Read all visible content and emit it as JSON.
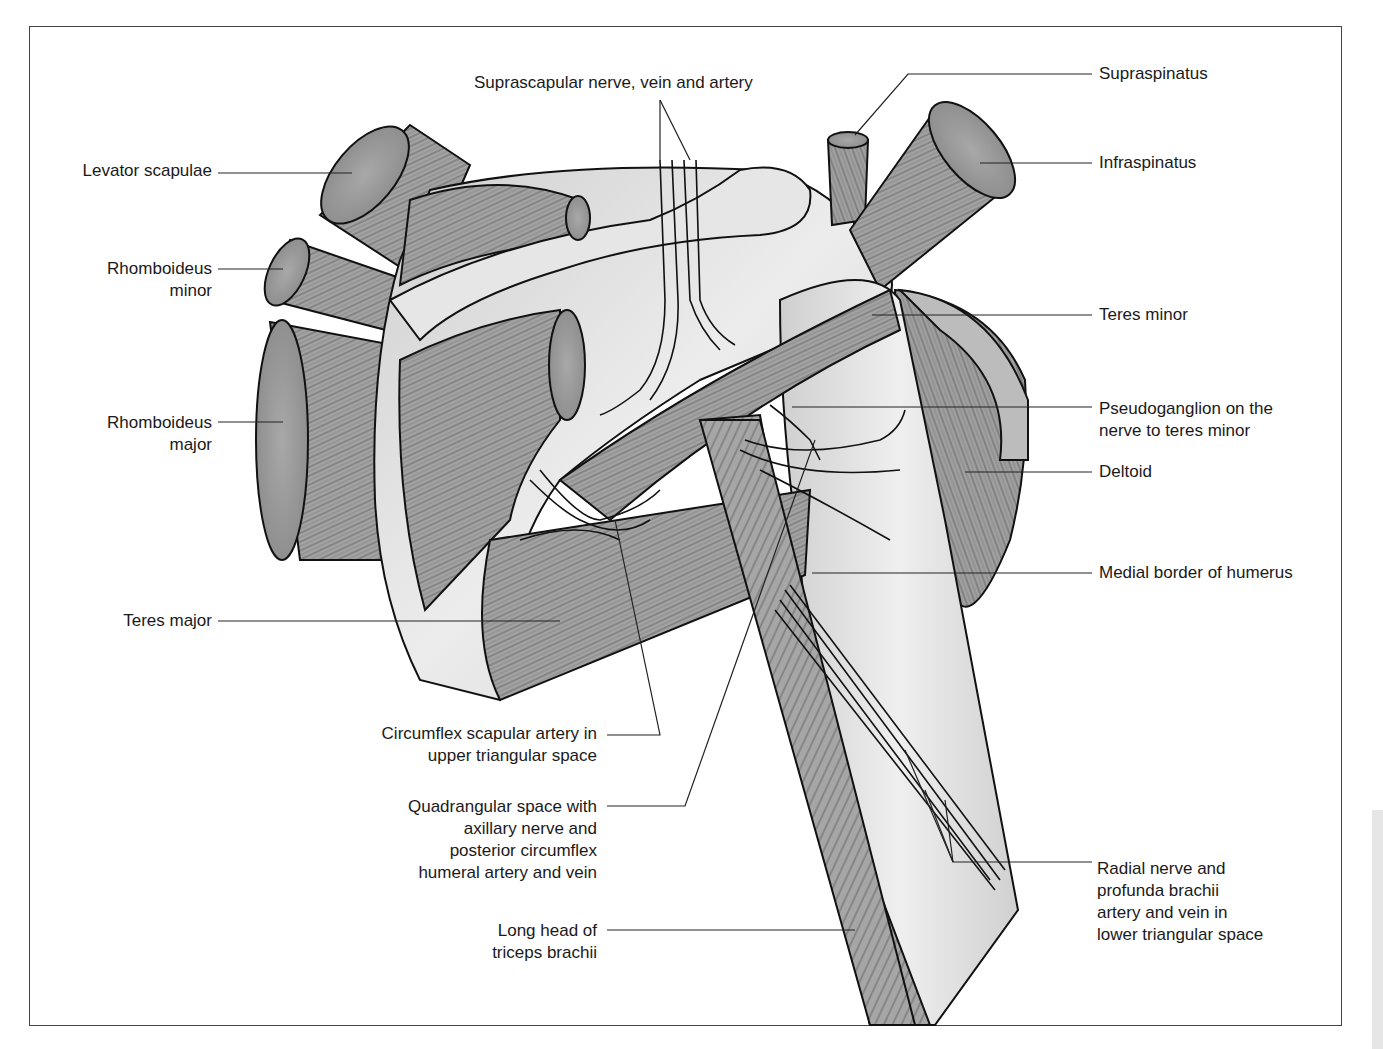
{
  "figure": {
    "colors": {
      "muscle_fill": "#9a9a9a",
      "muscle_cut_fill": "#b3b3b3",
      "bone_fill": "#dcdcdc",
      "vessel_fill": "#c4c4c4",
      "outline": "#111111",
      "leader_line": "#222222",
      "frame_border": "#444444"
    }
  },
  "labels": {
    "levator_scapulae": "Levator scapulae",
    "rhomboideus_minor": "Rhomboideus\nminor",
    "rhomboideus_major": "Rhomboideus\nmajor",
    "teres_major": "Teres major",
    "suprascapular": "Suprascapular nerve, vein and artery",
    "supraspinatus": "Supraspinatus",
    "infraspinatus": "Infraspinatus",
    "teres_minor": "Teres minor",
    "pseudoganglion": "Pseudoganglion on the\nnerve to teres minor",
    "deltoid": "Deltoid",
    "medial_border_humerus": "Medial border of humerus",
    "circumflex_scapular": "Circumflex scapular artery in\nupper triangular space",
    "quadrangular_space": "Quadrangular space with\naxillary nerve and\nposterior circumflex\nhumeral artery and vein",
    "long_head_triceps": "Long head of\ntriceps brachii",
    "radial_nerve": "Radial nerve and\nprofunda brachii\nartery and vein in\nlower triangular space"
  }
}
